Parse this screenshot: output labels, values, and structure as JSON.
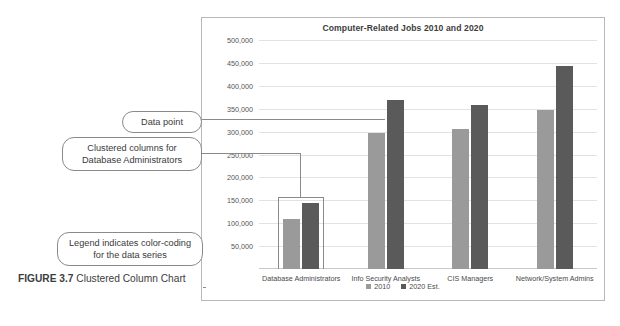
{
  "caption": {
    "figure_number": "FIGURE 3.7",
    "text": "Clustered Column Chart"
  },
  "callouts": {
    "data_point": "Data point",
    "clustered_columns": "Clustered columns for Database Administrators",
    "legend": "Legend indicates color-coding for the data series"
  },
  "chart_data": {
    "type": "bar",
    "title": "Computer-Related Jobs 2010 and 2020",
    "xlabel": "",
    "ylabel": "",
    "ylim": [
      0,
      500000
    ],
    "ytick_step": 50000,
    "yticks": [
      "500,000",
      "450,000",
      "400,000",
      "350,000",
      "300,000",
      "250,000",
      "200,000",
      "150,000",
      "100,000",
      "50,000"
    ],
    "grid": true,
    "legend_position": "bottom",
    "categories": [
      "Database Administrators",
      "Info Security Analysts",
      "CIS Managers",
      "Network/System Admins"
    ],
    "series": [
      {
        "name": "2010",
        "color": "#9a9a9a",
        "values": [
          110000,
          298000,
          305000,
          347000
        ]
      },
      {
        "name": "2020 Est.",
        "color": "#5a5a5a",
        "values": [
          145000,
          370000,
          358000,
          443000
        ]
      }
    ]
  }
}
